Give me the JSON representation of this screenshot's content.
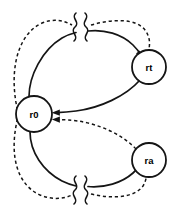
{
  "diagram": {
    "title": "",
    "type": "state-transition-graph",
    "canvas": {
      "width": 176,
      "height": 218,
      "background": "#ffffff"
    },
    "stroke_color": "#151515",
    "nodes": [
      {
        "id": "r0",
        "label": "r0",
        "cx": 34,
        "cy": 114,
        "r": 18
      },
      {
        "id": "rt",
        "label": "rt",
        "cx": 149,
        "cy": 67,
        "r": 17
      },
      {
        "id": "ra",
        "label": "ra",
        "cx": 149,
        "cy": 160,
        "r": 17
      }
    ],
    "edges": [
      {
        "id": "e1",
        "from": "r0",
        "to": "rt",
        "style": "solid",
        "arrow": true,
        "position": "upper",
        "note": "r0 to rt, solid curve with break mark"
      },
      {
        "id": "e2",
        "from": "rt",
        "to": "r0",
        "style": "solid",
        "arrow": true,
        "position": "upper-return",
        "note": "rt back to r0, solid curve"
      },
      {
        "id": "e3",
        "from": "r0",
        "to": "rt",
        "style": "dashed",
        "arrow": false,
        "position": "outer-top",
        "note": "dashed loop left and over the top with break mark"
      },
      {
        "id": "e4",
        "from": "r0",
        "to": "ra",
        "style": "solid",
        "arrow": true,
        "position": "lower",
        "note": "r0 to ra, solid curve with break mark"
      },
      {
        "id": "e5",
        "from": "ra",
        "to": "r0",
        "style": "dashed",
        "arrow": true,
        "position": "lower-return",
        "note": "ra back to r0, dashed curve"
      },
      {
        "id": "e6",
        "from": "r0",
        "to": "ra",
        "style": "dashed",
        "arrow": true,
        "position": "outer-bottom",
        "note": "dashed loop left and under the bottom with break mark"
      }
    ],
    "break_marks": [
      {
        "id": "b1",
        "x": 74,
        "y": 28,
        "on": "dashed-top"
      },
      {
        "id": "b2",
        "x": 88,
        "y": 28,
        "on": "solid-top"
      },
      {
        "id": "b3",
        "x": 74,
        "y": 190,
        "on": "solid-bottom"
      },
      {
        "id": "b4",
        "x": 88,
        "y": 190,
        "on": "dashed-bottom"
      }
    ]
  }
}
